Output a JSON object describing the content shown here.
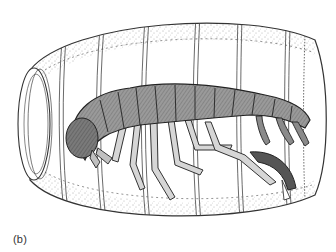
{
  "figure": {
    "panel_label": "(b)",
    "colors": {
      "ink": "#2a2a2a",
      "body_fill": "#8a8a8a",
      "body_light": "#c4c4c4",
      "stipple": "#555555",
      "background": "#ffffff"
    }
  }
}
